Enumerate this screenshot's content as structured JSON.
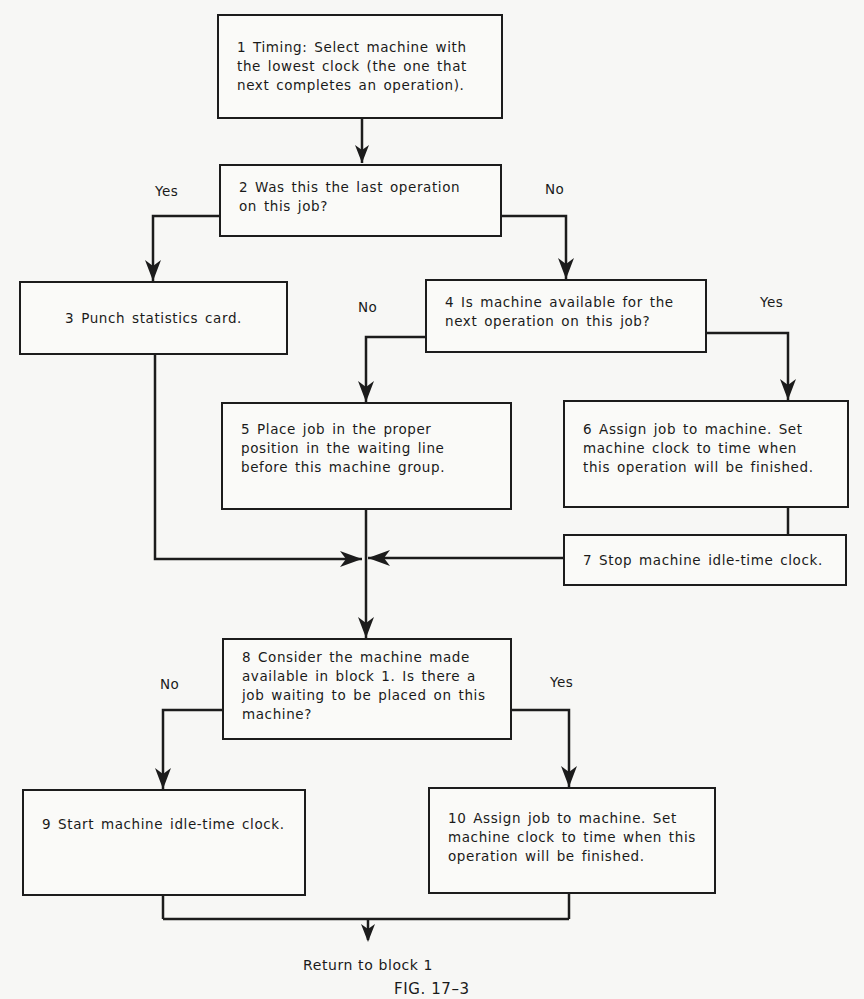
{
  "diagram": {
    "type": "flowchart",
    "figure_caption": "FIG. 17–3",
    "terminal_text": "Return to block 1",
    "blocks": [
      {
        "id": 1,
        "text": "1 Timing: Select machine with the lowest clock (the one that next completes an operation)."
      },
      {
        "id": 2,
        "text": "2 Was this the last operation on this job?"
      },
      {
        "id": 3,
        "text": "3 Punch statistics card."
      },
      {
        "id": 4,
        "text": "4 Is machine available for the next operation on this job?"
      },
      {
        "id": 5,
        "text": "5 Place job in the proper position in the waiting line before this machine group."
      },
      {
        "id": 6,
        "text": "6 Assign job to machine. Set machine clock to time when this operation will be finished."
      },
      {
        "id": 7,
        "text": "7 Stop machine idle-time clock."
      },
      {
        "id": 8,
        "text": "8 Consider the machine made available in block 1. Is there a job waiting to be placed on this machine?"
      },
      {
        "id": 9,
        "text": "9 Start machine idle-time clock."
      },
      {
        "id": 10,
        "text": "10 Assign job to machine. Set machine clock to time when this operation will be finished."
      }
    ],
    "branch_labels": {
      "b2_yes": "Yes",
      "b2_no": "No",
      "b4_no": "No",
      "b4_yes": "Yes",
      "b8_no": "No",
      "b8_yes": "Yes"
    },
    "edges": [
      {
        "from": 1,
        "to": 2
      },
      {
        "from": 2,
        "to": 3,
        "label": "Yes"
      },
      {
        "from": 2,
        "to": 4,
        "label": "No"
      },
      {
        "from": 4,
        "to": 5,
        "label": "No"
      },
      {
        "from": 4,
        "to": 6,
        "label": "Yes"
      },
      {
        "from": 6,
        "to": 7
      },
      {
        "from": 3,
        "to": 8
      },
      {
        "from": 5,
        "to": 8
      },
      {
        "from": 7,
        "to": 8
      },
      {
        "from": 8,
        "to": 9,
        "label": "No"
      },
      {
        "from": 8,
        "to": 10,
        "label": "Yes"
      },
      {
        "from": 9,
        "to": "return"
      },
      {
        "from": 10,
        "to": "return"
      }
    ],
    "colors": {
      "ink": "#1c1c1c",
      "paper": "#f7f7f5"
    }
  }
}
